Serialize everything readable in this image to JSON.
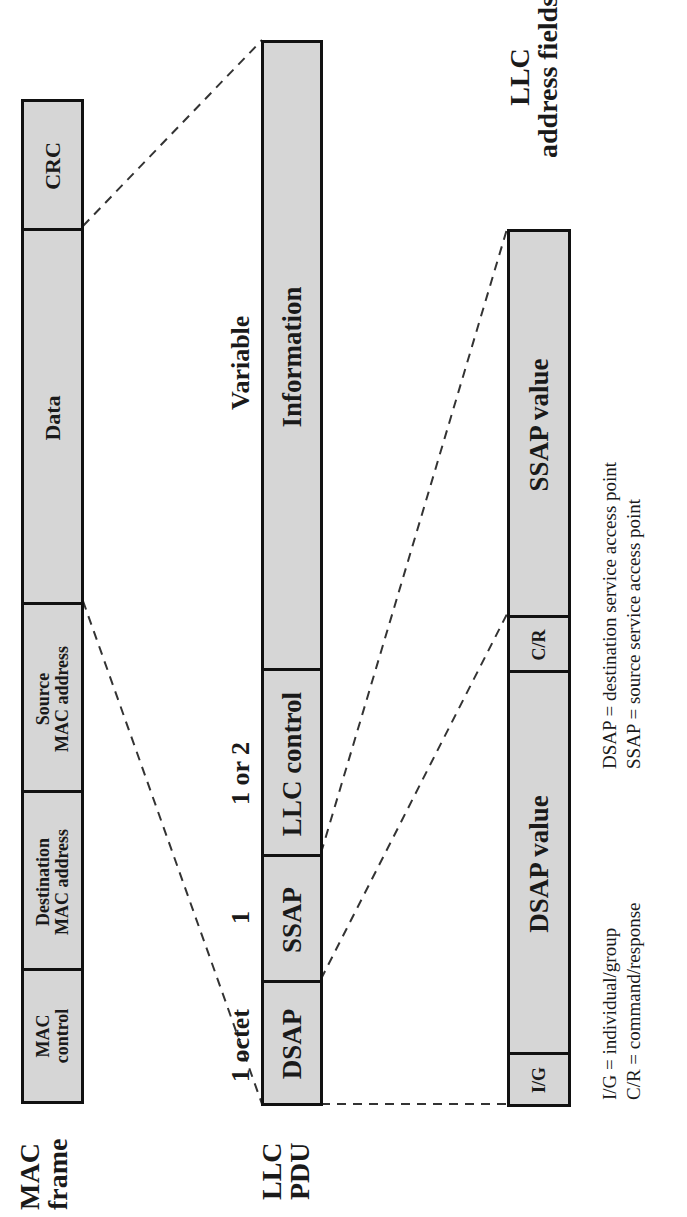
{
  "mac_frame": {
    "title_line1": "MAC",
    "title_line2": "frame",
    "fields": [
      {
        "line1": "MAC",
        "line2": "control"
      },
      {
        "line1": "Destination",
        "line2": "MAC address"
      },
      {
        "line1": "Source",
        "line2": "MAC address"
      },
      {
        "line1": "Data",
        "line2": ""
      },
      {
        "line1": "CRC",
        "line2": ""
      }
    ]
  },
  "llc_pdu": {
    "title_line1": "LLC",
    "title_line2": "PDU",
    "fields": [
      {
        "label": "DSAP",
        "size": "1 octet"
      },
      {
        "label": "SSAP",
        "size": "1"
      },
      {
        "label": "LLC control",
        "size": "1 or 2"
      },
      {
        "label": "Information",
        "size": "Variable"
      }
    ]
  },
  "llc_address_fields": {
    "title_line1": "LLC",
    "title_line2": "address fields",
    "fields": [
      {
        "label": "I/G"
      },
      {
        "label": "DSAP value"
      },
      {
        "label": "C/R"
      },
      {
        "label": "SSAP value"
      }
    ]
  },
  "legend": {
    "left": [
      "I/G = individual/group",
      "C/R = command/response"
    ],
    "right": [
      "DSAP = destination service access point",
      "SSAP = source service access point"
    ]
  },
  "colors": {
    "field_fill": "#d6d6d6",
    "border": "#111111",
    "dash": "#333333"
  }
}
